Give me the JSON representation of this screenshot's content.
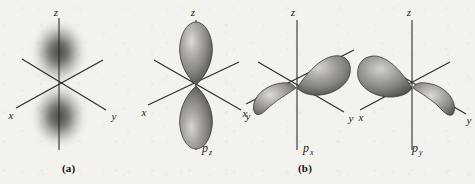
{
  "figure": {
    "background_color": "#f4f2ee",
    "ink_color": "#1d1c1a",
    "lobe_light_color": "#d8d5d0",
    "lobe_mid_color": "#8f8c88",
    "lobe_dark_color": "#4a4845",
    "cloud_color": "#5a5855"
  },
  "captions": {
    "a": "(a)",
    "b": "(b)"
  },
  "axes": {
    "x": "x",
    "y": "y",
    "z": "z"
  },
  "panels": [
    {
      "id": "electron-cloud",
      "caption": "(a)",
      "render": "electron-density-cloud",
      "orbital_label": "",
      "orbital_subscript": "",
      "axis_labels": {
        "x": "x",
        "y": "y",
        "z": "z"
      },
      "lobe_axis": "z",
      "description": "Fuzzy electron density cloud, dumbbell shaped along the z axis"
    },
    {
      "id": "p-z",
      "caption": "(b)",
      "render": "solid-lobes",
      "orbital_label": "p",
      "orbital_subscript": "z",
      "axis_labels": {
        "x": "x",
        "y": "y",
        "z": "z"
      },
      "lobe_axis": "z",
      "description": "Two shaded lobes aligned vertically along the z axis"
    },
    {
      "id": "p-x",
      "caption": "(b)",
      "render": "solid-lobes",
      "orbital_label": "p",
      "orbital_subscript": "x",
      "axis_labels": {
        "x": "x",
        "y": "y",
        "z": "z"
      },
      "lobe_axis": "x",
      "description": "Two shaded lobes aligned along the x axis, lower-left and upper-right"
    },
    {
      "id": "p-y",
      "caption": "(b)",
      "render": "solid-lobes",
      "orbital_label": "p",
      "orbital_subscript": "y",
      "axis_labels": {
        "x": "x",
        "y": "y",
        "z": "z"
      },
      "lobe_axis": "y",
      "description": "Two shaded lobes aligned along the y axis, upper-left and lower-right"
    }
  ]
}
